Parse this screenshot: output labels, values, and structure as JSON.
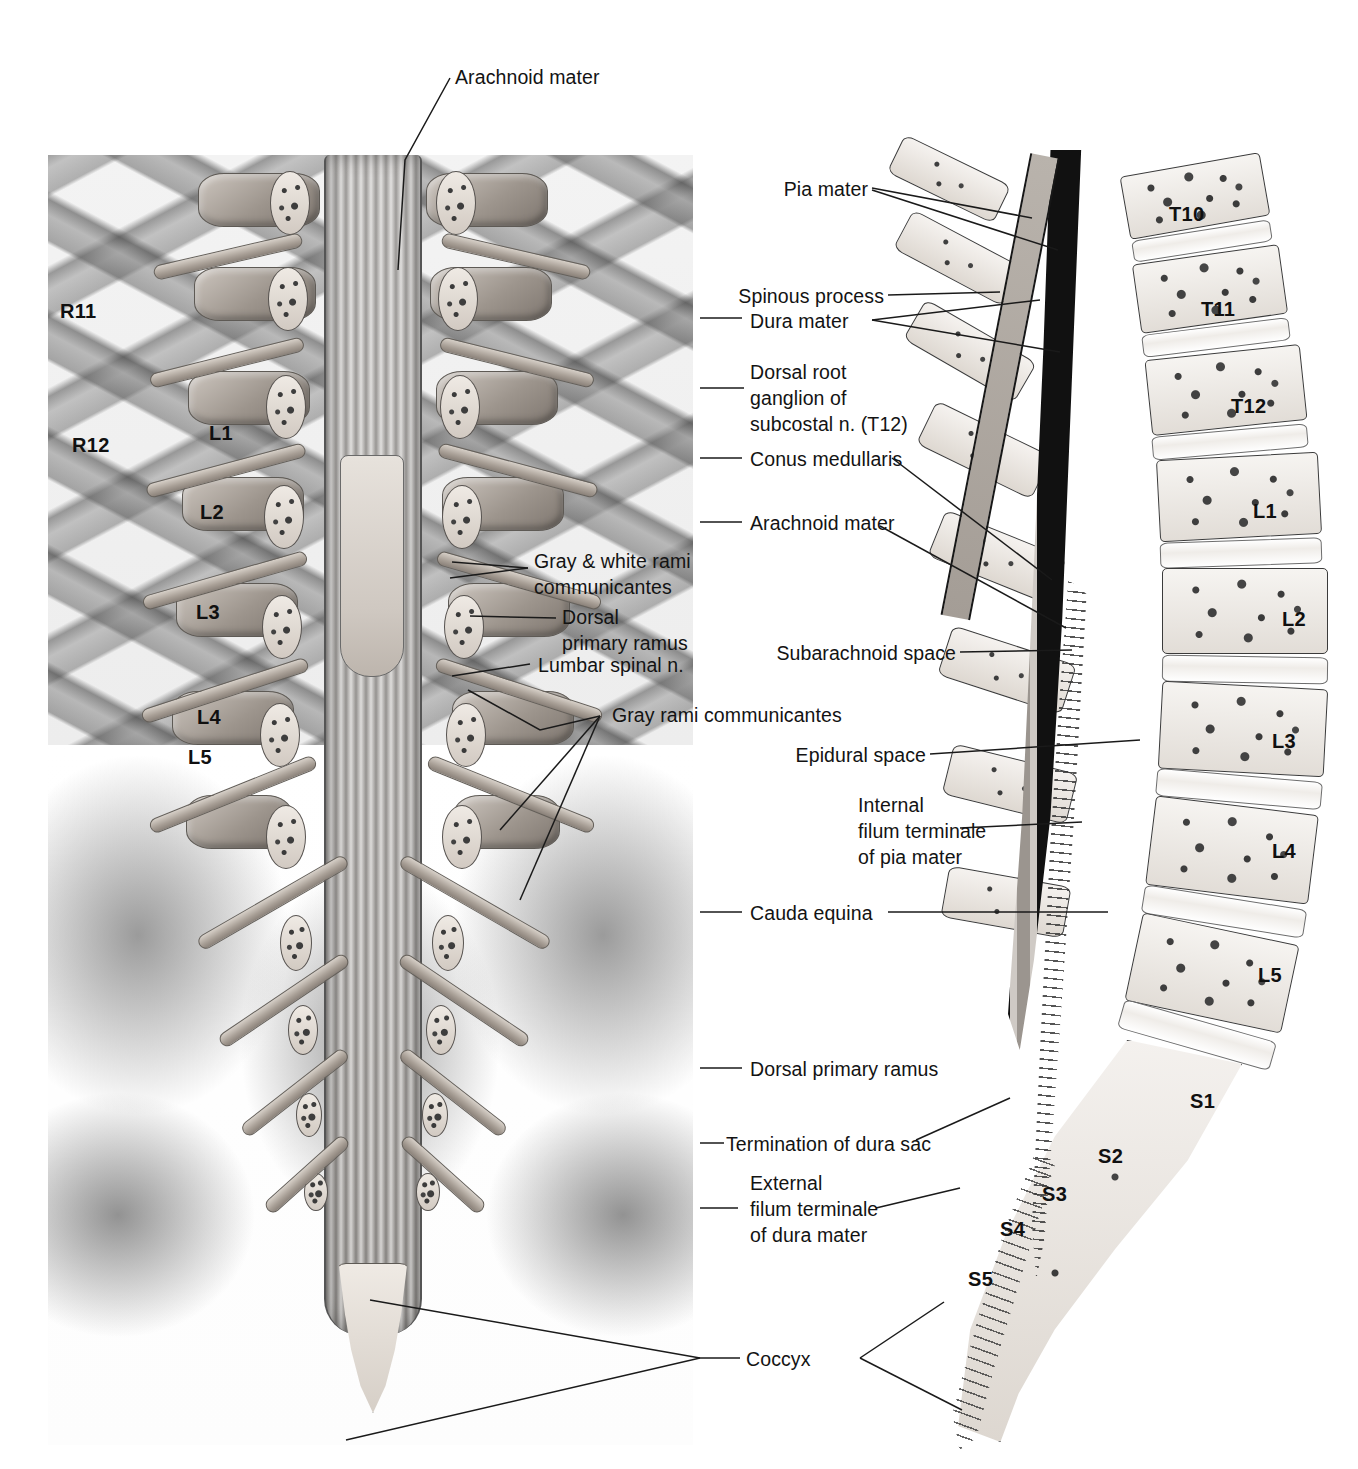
{
  "figure": {
    "type": "anatomical-illustration",
    "panels": [
      {
        "id": "left",
        "name": "posterior-view-lumbar-spine-sacrum"
      },
      {
        "id": "right",
        "name": "median-sagittal-section-vertebral-column"
      }
    ]
  },
  "labels": {
    "top": {
      "text": "Arachnoid mater"
    },
    "left_panel": [
      {
        "id": "gray-white-rami",
        "line1": "Gray & white rami",
        "line2": "communicantes"
      },
      {
        "id": "dorsal-primary-ramus-upper",
        "line1": "Dorsal",
        "line2": "primary ramus"
      },
      {
        "id": "lumbar-spinal-n",
        "line1": "Lumbar spinal n."
      },
      {
        "id": "gray-rami",
        "line1": "Gray rami communicantes"
      }
    ],
    "right_panel": [
      {
        "id": "pia-mater",
        "line1": "Pia mater"
      },
      {
        "id": "spinous-process",
        "line1": "Spinous process"
      },
      {
        "id": "dura-mater",
        "line1": "Dura mater"
      },
      {
        "id": "dorsal-root-ganglion",
        "line1": "Dorsal root",
        "line2": "ganglion of",
        "line3": "subcostal n. (T12)"
      },
      {
        "id": "conus-medullaris",
        "line1": "Conus medullaris"
      },
      {
        "id": "arachnoid-mater-2",
        "line1": "Arachnoid mater"
      },
      {
        "id": "subarachnoid-space",
        "line1": "Subarachnoid space"
      },
      {
        "id": "epidural-space",
        "line1": "Epidural space"
      },
      {
        "id": "internal-filum-terminale",
        "line1": "Internal",
        "line2": "filum terminale",
        "line3": "of pia mater"
      },
      {
        "id": "cauda-equina",
        "line1": "Cauda equina"
      },
      {
        "id": "dorsal-primary-ramus",
        "line1": "Dorsal primary ramus"
      },
      {
        "id": "termination-dura-sac",
        "line1": "Termination of dura sac"
      },
      {
        "id": "external-filum-terminale",
        "line1": "External",
        "line2": "filum terminale",
        "line3": "of dura mater"
      },
      {
        "id": "coccyx",
        "line1": "Coccyx"
      }
    ]
  },
  "vertebral_levels": {
    "left_panel": [
      {
        "id": "R11",
        "label": "R11"
      },
      {
        "id": "R12",
        "label": "R12"
      },
      {
        "id": "L1",
        "label": "L1"
      },
      {
        "id": "L2",
        "label": "L2"
      },
      {
        "id": "L3",
        "label": "L3"
      },
      {
        "id": "L4",
        "label": "L4"
      },
      {
        "id": "L5",
        "label": "L5"
      }
    ],
    "right_panel": [
      {
        "id": "T10",
        "label": "T10"
      },
      {
        "id": "T11",
        "label": "T11"
      },
      {
        "id": "T12",
        "label": "T12"
      },
      {
        "id": "L1",
        "label": "L1"
      },
      {
        "id": "L2",
        "label": "L2"
      },
      {
        "id": "L3",
        "label": "L3"
      },
      {
        "id": "L4",
        "label": "L4"
      },
      {
        "id": "L5",
        "label": "L5"
      },
      {
        "id": "S1",
        "label": "S1"
      },
      {
        "id": "S2",
        "label": "S2"
      },
      {
        "id": "S3",
        "label": "S3"
      },
      {
        "id": "S4",
        "label": "S4"
      },
      {
        "id": "S5",
        "label": "S5"
      }
    ]
  },
  "colors": {
    "background": "#ffffff",
    "text": "#131313",
    "leader_line": "#1a1a1a",
    "bone_light": "#f4f1ee",
    "bone_mid": "#b4aea8",
    "bone_dark": "#7e766f"
  }
}
